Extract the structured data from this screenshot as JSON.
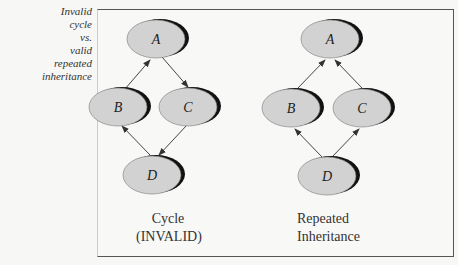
{
  "caption": [
    "Invalid",
    "cycle",
    "vs.",
    "valid",
    "repeated",
    "inheritance"
  ],
  "diagrams": [
    {
      "name": "cycle",
      "nodes": {
        "A": "A",
        "B": "B",
        "C": "C",
        "D": "D"
      },
      "label": [
        "Cycle",
        "(INVALID)"
      ]
    },
    {
      "name": "repeated",
      "nodes": {
        "A": "A",
        "B": "B",
        "C": "C",
        "D": "D"
      },
      "label": [
        "Repeated",
        "Inheritance"
      ]
    }
  ],
  "colors": {
    "node_fill": "#d2d2d2",
    "node_shadow": "#111111",
    "edge": "#444444"
  }
}
